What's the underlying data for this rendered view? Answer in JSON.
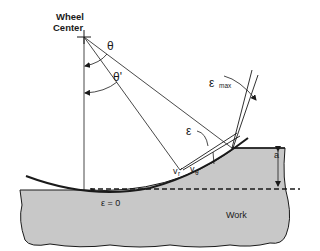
{
  "diagram": {
    "type": "grinding-wheel-contact-geometry",
    "labels": {
      "wheel_center_line1": "Wheel",
      "wheel_center_line2": "Center",
      "theta": "θ",
      "theta_prime": "θ'",
      "epsilon_max": "ε",
      "epsilon_max_sub": "max",
      "epsilon": "ε",
      "v_r": "v",
      "v_r_sub": "r",
      "v_theta": "v",
      "v_theta_sub": "θ",
      "depth": "a",
      "epsilon_zero": "ε = 0",
      "work": "Work"
    },
    "colors": {
      "line": "#1a1a1a",
      "work_fill": "#c8c8c8",
      "background": "#ffffff"
    }
  }
}
